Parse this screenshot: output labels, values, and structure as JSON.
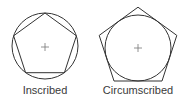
{
  "diagrams": [
    {
      "label": "Inscribed",
      "center": [
        45,
        46
      ],
      "radius": 33,
      "polygon": "pentagon inscribed in circle"
    },
    {
      "label": "Circumscribed",
      "center": [
        138,
        48
      ],
      "radius": 33,
      "polygon": "pentagon circumscribed about circle"
    }
  ],
  "colors": {
    "stroke": "#333333",
    "text": "#3a3a3a",
    "background": "#ffffff"
  }
}
